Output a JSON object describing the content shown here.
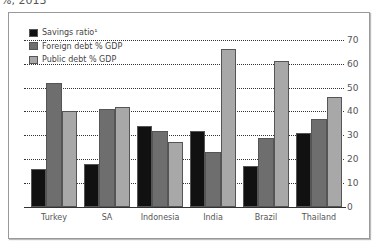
{
  "subtitle": "%, 2013",
  "legend": [
    {
      "label": "Savings ratio¹",
      "color": "#111111"
    },
    {
      "label": "Foreign debt % GDP",
      "color": "#6e6e6e"
    },
    {
      "label": "Public debt % GDP",
      "color": "#a8a8a8"
    }
  ],
  "chart_data": {
    "type": "bar",
    "title": "",
    "subtitle": "%, 2013",
    "categories": [
      "Turkey",
      "SA",
      "Indonesia",
      "India",
      "Brazil",
      "Thailand"
    ],
    "series": [
      {
        "name": "Savings ratio¹",
        "values": [
          16,
          18,
          34,
          32,
          17,
          31
        ]
      },
      {
        "name": "Foreign debt % GDP",
        "values": [
          52,
          41,
          32,
          23,
          29,
          37
        ]
      },
      {
        "name": "Public debt % GDP",
        "values": [
          40,
          42,
          27,
          66,
          61,
          46
        ]
      }
    ],
    "xlabel": "",
    "ylabel": "",
    "ylim": [
      0,
      70
    ],
    "yticks": [
      0,
      10,
      20,
      30,
      40,
      50,
      60,
      70
    ],
    "y_axis_position": "right",
    "grid": "horizontal dotted",
    "legend_position": "top-left"
  }
}
